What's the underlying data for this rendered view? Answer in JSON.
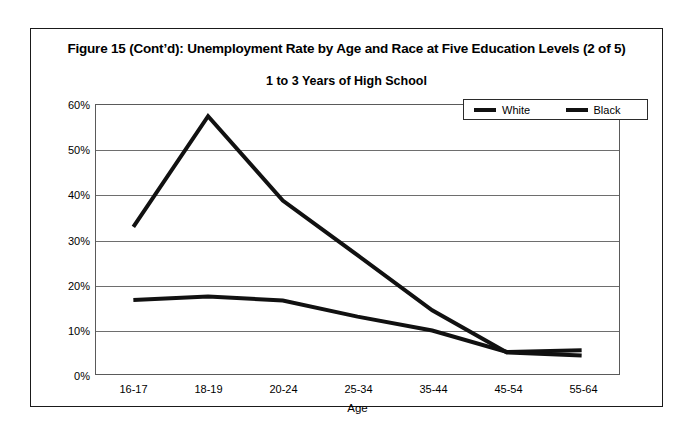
{
  "figure": {
    "title": "Figure 15 (Cont’d): Unemployment Rate by Age and Race at Five Education Levels (2 of 5)"
  },
  "chart_data": {
    "type": "line",
    "title": "1 to 3 Years of High School",
    "xlabel": "Age",
    "ylabel": "",
    "categories": [
      "16-17",
      "18-19",
      "20-24",
      "25-34",
      "35-44",
      "45-54",
      "55-64"
    ],
    "series": [
      {
        "name": "White",
        "color": "#111111",
        "values": [
          16.5,
          17.3,
          16.4,
          12.8,
          9.7,
          4.9,
          5.3
        ]
      },
      {
        "name": "Black",
        "color": "#111111",
        "values": [
          32.8,
          57.5,
          38.7,
          26.5,
          14.2,
          4.8,
          4.1
        ]
      }
    ],
    "ylim": [
      0,
      60
    ],
    "yticks": [
      0,
      10,
      20,
      30,
      40,
      50,
      60
    ],
    "ytick_labels": [
      "0%",
      "10%",
      "20%",
      "30%",
      "40%",
      "50%",
      "60%"
    ],
    "grid": true,
    "legend_position": "top-right",
    "legend_entries": [
      "White",
      "Black"
    ]
  }
}
